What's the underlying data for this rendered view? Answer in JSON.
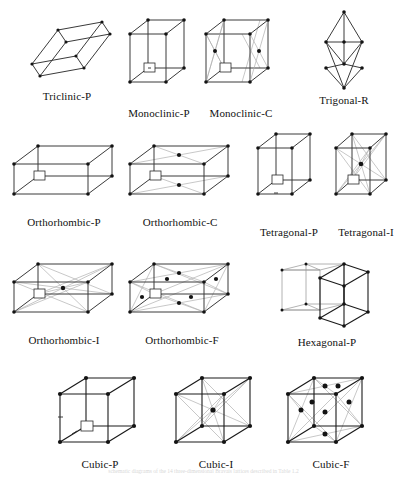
{
  "figure": {
    "background_color": "#ffffff",
    "line_color": "#1a1a1a",
    "node_color": "#131313",
    "diagonal_color": "#b0b0b0",
    "footnote": "schematic diagrams of the 14 three-dimensional Bravais lattices described in Table 1.2"
  },
  "rows": [
    {
      "index": 0,
      "items": [
        {
          "id": "triclinic-p",
          "label": "Triclinic-P",
          "system": "triclinic",
          "centering": "P",
          "lattice_points": 8,
          "extra_points": 0
        },
        {
          "id": "monoclinic-p",
          "label": "Monoclinic-P",
          "system": "monoclinic",
          "centering": "P",
          "lattice_points": 8,
          "extra_points": 0
        },
        {
          "id": "monoclinic-c",
          "label": "Monoclinic-C",
          "system": "monoclinic",
          "centering": "C",
          "lattice_points": 8,
          "extra_points": 2
        },
        {
          "id": "trigonal-r",
          "label": "Trigonal-R",
          "system": "trigonal",
          "centering": "R",
          "lattice_points": 8,
          "extra_points": 0
        }
      ]
    },
    {
      "index": 1,
      "items": [
        {
          "id": "orthorhombic-p",
          "label": "Orthorhombic-P",
          "system": "orthorhombic",
          "centering": "P",
          "lattice_points": 8,
          "extra_points": 0
        },
        {
          "id": "orthorhombic-c",
          "label": "Orthorhombic-C",
          "system": "orthorhombic",
          "centering": "C",
          "lattice_points": 8,
          "extra_points": 2
        },
        {
          "id": "tetragonal-p",
          "label": "Tetragonal-P",
          "system": "tetragonal",
          "centering": "P",
          "lattice_points": 8,
          "extra_points": 0
        },
        {
          "id": "tetragonal-i",
          "label": "Tetragonal-I",
          "system": "tetragonal",
          "centering": "I",
          "lattice_points": 8,
          "extra_points": 1
        }
      ]
    },
    {
      "index": 2,
      "items": [
        {
          "id": "orthorhombic-i",
          "label": "Orthorhombic-I",
          "system": "orthorhombic",
          "centering": "I",
          "lattice_points": 8,
          "extra_points": 1
        },
        {
          "id": "orthorhombic-f",
          "label": "Orthorhombic-F",
          "system": "orthorhombic",
          "centering": "F",
          "lattice_points": 8,
          "extra_points": 6
        },
        {
          "id": "hexagonal-p",
          "label": "Hexagonal-P",
          "system": "hexagonal",
          "centering": "P",
          "lattice_points": 8,
          "extra_points": 0
        }
      ]
    },
    {
      "index": 3,
      "items": [
        {
          "id": "cubic-p",
          "label": "Cubic-P",
          "system": "cubic",
          "centering": "P",
          "lattice_points": 8,
          "extra_points": 0
        },
        {
          "id": "cubic-i",
          "label": "Cubic-I",
          "system": "cubic",
          "centering": "I",
          "lattice_points": 8,
          "extra_points": 1
        },
        {
          "id": "cubic-f",
          "label": "Cubic-F",
          "system": "cubic",
          "centering": "F",
          "lattice_points": 8,
          "extra_points": 6
        }
      ]
    }
  ],
  "labels": {
    "triclinic_p": "Triclinic-P",
    "monoclinic_p": "Monoclinic-P",
    "monoclinic_c": "Monoclinic-C",
    "trigonal_r": "Trigonal-R",
    "orthorhombic_p": "Orthorhombic-P",
    "orthorhombic_c": "Orthorhombic-C",
    "tetragonal_p": "Tetragonal-P",
    "tetragonal_i": "Tetragonal-I",
    "orthorhombic_i": "Orthorhombic-I",
    "orthorhombic_f": "Orthorhombic-F",
    "hexagonal_p": "Hexagonal-P",
    "cubic_p": "Cubic-P",
    "cubic_i": "Cubic-I",
    "cubic_f": "Cubic-F"
  }
}
